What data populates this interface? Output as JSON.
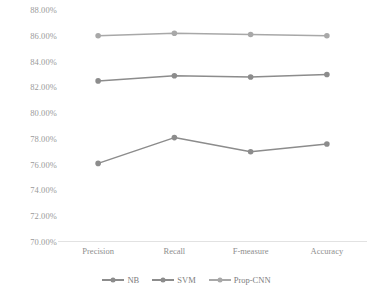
{
  "chart_data": {
    "type": "line",
    "title": "",
    "xlabel": "",
    "ylabel": "",
    "categories": [
      "Precision",
      "Recall",
      "F-measure",
      "Accuracy"
    ],
    "ylim": [
      70.0,
      88.0
    ],
    "ytick_step": 2.0,
    "ytick_labels": [
      "88.00%",
      "86.00%",
      "84.00%",
      "82.00%",
      "80.00%",
      "78.00%",
      "76.00%",
      "74.00%",
      "72.00%",
      "70.00%"
    ],
    "ytick_values": [
      88.0,
      86.0,
      84.0,
      82.0,
      80.0,
      78.0,
      76.0,
      74.0,
      72.0,
      70.0
    ],
    "grid": false,
    "legend_position": "bottom",
    "series": [
      {
        "name": "NB",
        "values": [
          76.1,
          78.1,
          77.0,
          77.6
        ],
        "color": "#8c8c8c"
      },
      {
        "name": "SVM",
        "values": [
          82.5,
          82.9,
          82.8,
          83.0
        ],
        "color": "#8c8c8c"
      },
      {
        "name": "Prop-CNN",
        "values": [
          86.0,
          86.2,
          86.1,
          86.0
        ],
        "color": "#a8a8a8"
      }
    ]
  },
  "axis": {
    "baseline_color": "#e2e2e2",
    "tick_text_color": "#9a9a9a"
  },
  "legend": {
    "items": [
      {
        "label": "NB"
      },
      {
        "label": "SVM"
      },
      {
        "label": "Prop-CNN"
      }
    ]
  }
}
